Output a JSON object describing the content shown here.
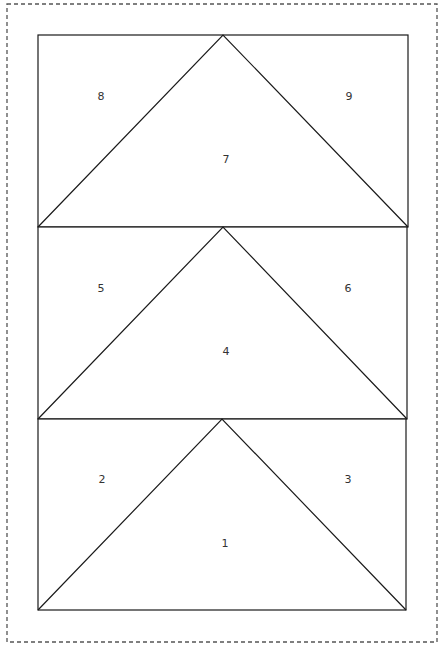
{
  "diagram": {
    "type": "quilt-block-template",
    "frame": {
      "x": 7,
      "y": 4,
      "width": 430,
      "height": 638,
      "style": "dashed"
    },
    "units": [
      {
        "name": "top-unit",
        "rect": {
          "x1": 38,
          "y1": 35,
          "x2": 408,
          "y2": 227
        },
        "apex": {
          "x": 223,
          "y": 35
        },
        "base": {
          "y": 227
        },
        "pieces": [
          {
            "id": "8",
            "label": "8",
            "x": 101,
            "y": 96
          },
          {
            "id": "9",
            "label": "9",
            "x": 349,
            "y": 96
          },
          {
            "id": "7",
            "label": "7",
            "x": 226,
            "y": 159
          }
        ]
      },
      {
        "name": "middle-unit",
        "rect": {
          "x1": 38,
          "y1": 227,
          "x2": 407,
          "y2": 419
        },
        "apex": {
          "x": 223,
          "y": 227
        },
        "base": {
          "y": 419
        },
        "pieces": [
          {
            "id": "5",
            "label": "5",
            "x": 101,
            "y": 288
          },
          {
            "id": "6",
            "label": "6",
            "x": 348,
            "y": 288
          },
          {
            "id": "4",
            "label": "4",
            "x": 226,
            "y": 351
          }
        ]
      },
      {
        "name": "bottom-unit",
        "rect": {
          "x1": 38,
          "y1": 419,
          "x2": 406,
          "y2": 610
        },
        "apex": {
          "x": 222,
          "y": 419
        },
        "base": {
          "y": 610
        },
        "pieces": [
          {
            "id": "2",
            "label": "2",
            "x": 102,
            "y": 479
          },
          {
            "id": "3",
            "label": "3",
            "x": 348,
            "y": 479
          },
          {
            "id": "1",
            "label": "1",
            "x": 225,
            "y": 543
          }
        ]
      }
    ],
    "colors": {
      "line": "#1a1a1a",
      "frame": "#555555",
      "label": "#333333",
      "background": "#ffffff"
    }
  }
}
